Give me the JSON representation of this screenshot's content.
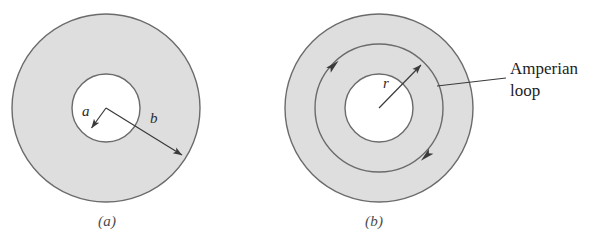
{
  "figure": {
    "background_color": "#ffffff",
    "shading_color": "#dedede",
    "outline_color": "#6b6b6b",
    "arrow_color": "#3a3a3a",
    "text_color": "#1d1d1d"
  },
  "panels": [
    {
      "id": "a",
      "caption": "(a)",
      "center": {
        "x": 106,
        "y": 108
      },
      "circles": [
        {
          "name": "outer-conductor-boundary",
          "radius": 94,
          "fill": "#dedede"
        },
        {
          "name": "inner-hole-boundary",
          "radius": 34,
          "fill": "#ffffff"
        }
      ],
      "dimension_arrows": [
        {
          "name": "radius-a-arrow",
          "label": "a",
          "from": {
            "x": 106,
            "y": 108
          },
          "to": {
            "x": 90,
            "y": 130
          }
        },
        {
          "name": "radius-b-arrow",
          "label": "b",
          "from": {
            "x": 106,
            "y": 108
          },
          "to": {
            "x": 185,
            "y": 157
          }
        }
      ]
    },
    {
      "id": "b",
      "caption": "(b)",
      "center": {
        "x": 379,
        "y": 108
      },
      "circles": [
        {
          "name": "outer-conductor-boundary",
          "radius": 94,
          "fill": "#dedede"
        },
        {
          "name": "amperian-loop",
          "radius": 64,
          "fill": "none"
        },
        {
          "name": "inner-hole-boundary",
          "radius": 34,
          "fill": "#ffffff"
        }
      ],
      "dimension_arrows": [
        {
          "name": "radius-r-arrow",
          "label": "r",
          "from": {
            "x": 379,
            "y": 108
          },
          "to": {
            "x": 424,
            "y": 62
          }
        }
      ],
      "loop_direction_arrowheads": [
        {
          "name": "loop-arrowhead-upper-left",
          "at": {
            "x": 333,
            "y": 65
          }
        },
        {
          "name": "loop-arrowhead-lower-right",
          "at": {
            "x": 427,
            "y": 156
          }
        }
      ],
      "annotation": {
        "name": "amperian-loop-callout",
        "text": "Amperian\nloop",
        "leader_line": [
          {
            "x": 506,
            "y": 78
          },
          {
            "x": 437,
            "y": 86
          },
          {
            "x": 424,
            "y": 62
          }
        ]
      }
    }
  ]
}
